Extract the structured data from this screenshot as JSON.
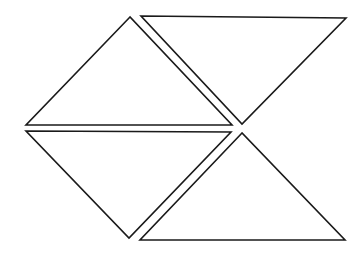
{
  "diagram": {
    "background": "#ffffff",
    "stroke_color": "#1a1a1a",
    "shapes": [
      {
        "name": "triangle-top-left",
        "points": "130,17 26,125 232,125"
      },
      {
        "name": "triangle-top-right",
        "points": "141,16 346,18 242,124"
      },
      {
        "name": "triangle-bottom-left",
        "points": "26,131 231,132 129,238"
      },
      {
        "name": "triangle-bottom-right",
        "points": "242,133 140,240 345,240"
      }
    ]
  }
}
